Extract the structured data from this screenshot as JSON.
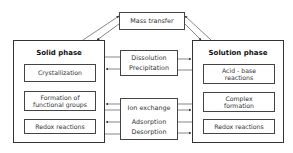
{
  "diagram": {
    "mass_transfer": "Mass transfer",
    "solid_phase": {
      "title": "Solid phase",
      "items": [
        {
          "line1": "Crystallization",
          "line2": ""
        },
        {
          "line1": "Formation of",
          "line2": "functional groups"
        },
        {
          "line1": "Redox reactions",
          "line2": ""
        }
      ]
    },
    "solution_phase": {
      "title": "Solution phase",
      "items": [
        {
          "line1": "Acid - base",
          "line2": "reactions"
        },
        {
          "line1": "Complex",
          "line2": "formation"
        },
        {
          "line1": "Redox reactions",
          "line2": ""
        }
      ]
    },
    "dissolution_box": {
      "line1": "Dissolution",
      "line2": "Precipitation"
    },
    "exchange_box": {
      "line1": "Ion exchange",
      "line2": "Adsorption",
      "line3": "Desorption"
    },
    "colors": {
      "line": "#333333",
      "background": "#ffffff"
    }
  }
}
